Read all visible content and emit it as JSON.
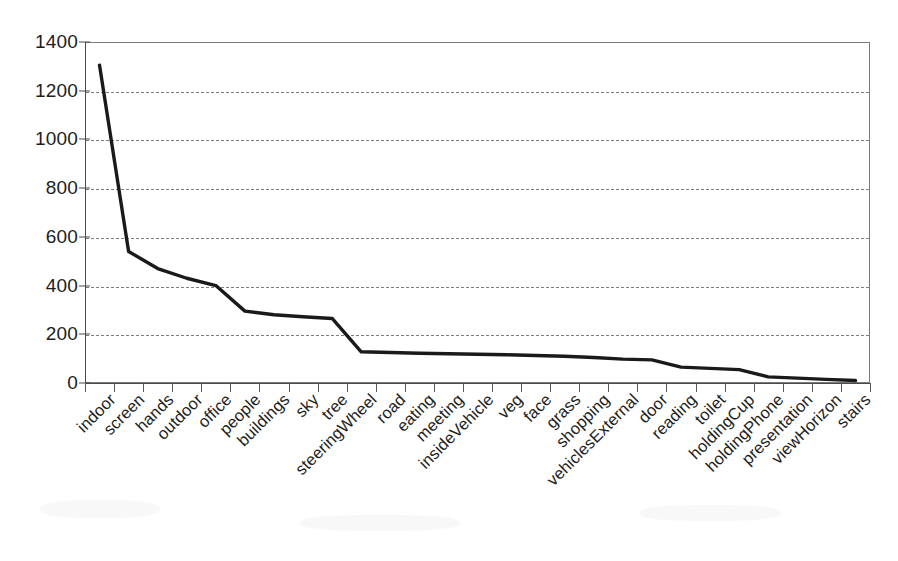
{
  "chart_data": {
    "type": "line",
    "title": "",
    "subtitle": "",
    "xlabel": "",
    "ylabel": "",
    "ylim": [
      0,
      1400
    ],
    "ytick_step": 200,
    "grid": true,
    "grid_style": "dashed-horizontal",
    "legend": "none",
    "line_color": "#1a1a1a",
    "categories": [
      "indoor",
      "screen",
      "hands",
      "outdoor",
      "office",
      "people",
      "buildings",
      "sky",
      "tree",
      "steeringWheel",
      "road",
      "eating",
      "meeting",
      "insideVehicle",
      "veg",
      "face",
      "grass",
      "shopping",
      "vehiclesExternal",
      "door",
      "reading",
      "toilet",
      "holdingCup",
      "holdingPhone",
      "presentation",
      "viewHorizon",
      "stairs"
    ],
    "values": [
      1305,
      540,
      470,
      430,
      400,
      295,
      280,
      272,
      265,
      128,
      125,
      122,
      120,
      118,
      116,
      113,
      110,
      105,
      98,
      95,
      65,
      60,
      55,
      25,
      20,
      15,
      10
    ],
    "ytick_labels": [
      "0",
      "200",
      "400",
      "600",
      "800",
      "1000",
      "1200",
      "1400"
    ],
    "ytick_values": [
      0,
      200,
      400,
      600,
      800,
      1000,
      1200,
      1400
    ]
  }
}
